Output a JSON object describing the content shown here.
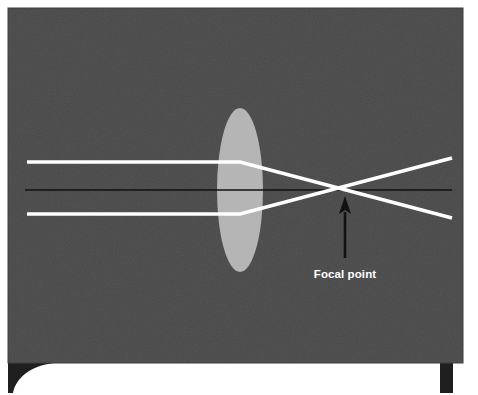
{
  "figure": {
    "annotations": [
      {
        "id": "focal-point",
        "label": "Focal point",
        "x": 345,
        "y": 190
      }
    ],
    "colors": {
      "panel_background": "#4a4a4a",
      "panel_border": "#3d3d3d",
      "lens_fill": "#b5b5b5",
      "ray_stroke": "#ffffff",
      "axis_stroke": "#111111",
      "pointer_stroke": "#111111",
      "label_color": "#ffffff",
      "page_background": "#ffffff",
      "foot_fill": "#1f1f1f"
    },
    "panel": {
      "x": 8,
      "y": 8,
      "width": 455,
      "height": 355
    },
    "lens": {
      "center_x": 240,
      "center_y": 190,
      "half_width": 23,
      "half_height": 82,
      "fill": "#b5b5b5"
    },
    "optical_axis": {
      "x1": 25,
      "y1": 190,
      "x2": 452,
      "y2": 190,
      "stroke_width": 1.6
    },
    "rays": [
      {
        "name": "upper-ray",
        "incoming": {
          "x1": 27,
          "y1": 162,
          "x2": 240,
          "y2": 162
        },
        "refracted": {
          "x1": 240,
          "y1": 162,
          "x2": 452,
          "y2": 218
        }
      },
      {
        "name": "lower-ray",
        "incoming": {
          "x1": 27,
          "y1": 214,
          "x2": 240,
          "y2": 214
        },
        "refracted": {
          "x1": 240,
          "y1": 214,
          "x2": 452,
          "y2": 158
        }
      }
    ],
    "pointer": {
      "name": "focal-point-arrow",
      "shaft_x": 345,
      "shaft_top": 198,
      "shaft_bottom": 258,
      "head_half_width": 6,
      "head_height": 16,
      "stroke_width": 2.4
    },
    "feet": [
      {
        "name": "left-foot",
        "type": "curved-fillet",
        "x": 8,
        "y": 363,
        "width": 46,
        "height": 30
      },
      {
        "name": "right-foot",
        "type": "rectangle",
        "x": 440,
        "y": 363,
        "width": 13,
        "height": 30
      }
    ]
  }
}
